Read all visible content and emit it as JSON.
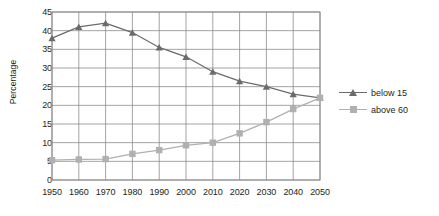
{
  "chart_data": {
    "type": "line",
    "title": "",
    "xlabel": "",
    "ylabel": "Percentage",
    "x": [
      1950,
      1960,
      1970,
      1980,
      1990,
      2000,
      2010,
      2020,
      2030,
      2040,
      2050
    ],
    "xticklabels": [
      "1950",
      "1960",
      "1970",
      "1980",
      "1990",
      "2000",
      "2010",
      "2020",
      "2030",
      "2040",
      "2050"
    ],
    "yticklabels": [
      "0",
      "5",
      "10",
      "15",
      "20",
      "25",
      "30",
      "35",
      "40",
      "45"
    ],
    "ylim": [
      0,
      45
    ],
    "ytick_step": 5,
    "xlim": [
      1950,
      2050
    ],
    "grid": "both",
    "legend_position": "right",
    "series": [
      {
        "name": "below 15",
        "marker": "triangle",
        "color": "#6b6b6b",
        "values": [
          38,
          41,
          42,
          39.5,
          35.5,
          33,
          29,
          26.5,
          25,
          23,
          22
        ]
      },
      {
        "name": "above 60",
        "marker": "square",
        "color": "#b0b0b0",
        "values": [
          5.3,
          5.5,
          5.6,
          7,
          8,
          9.3,
          10,
          12.5,
          15.5,
          19,
          22
        ]
      }
    ]
  },
  "legend": {
    "items": [
      {
        "label": "below 15"
      },
      {
        "label": "above 60"
      }
    ]
  },
  "colors": {
    "series_below_15": "#6b6b6b",
    "series_above_60": "#b0b0b0",
    "grid": "#8c8c8c",
    "axis_text": "#231f20",
    "background": "#ffffff"
  }
}
